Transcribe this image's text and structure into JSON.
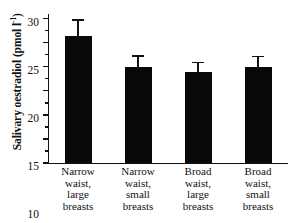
{
  "chart_data": {
    "type": "bar",
    "title": "",
    "xlabel": "",
    "ylabel": "Salivary oestradiol (pmol l",
    "ylabel_sup": "-1",
    "ylabel_tail": ")",
    "categories": [
      "Narrow waist, large breasts",
      "Narrow waist, small breasts",
      "Broad waist, large breasts",
      "Broad waist, small breasts"
    ],
    "category_lines": [
      [
        "Narrow",
        "waist,",
        "large",
        "breasts"
      ],
      [
        "Narrow",
        "waist,",
        "small",
        "breasts"
      ],
      [
        "Broad",
        "waist,",
        "large",
        "breasts"
      ],
      [
        "Broad",
        "waist,",
        "small",
        "breasts"
      ]
    ],
    "values": [
      26.4,
      19.9,
      18.9,
      20.0
    ],
    "errors": [
      3.5,
      2.5,
      2.2,
      2.3
    ],
    "error_type": "standard error",
    "ylim": [
      0,
      31
    ],
    "yticks": [
      0,
      5,
      10,
      15,
      20,
      25,
      30
    ],
    "ytick_labels": [
      "0",
      "5",
      "10",
      "15",
      "20",
      "25",
      "30"
    ],
    "grid": false,
    "legend": null,
    "bar_color": "#090909",
    "axis_color": "#111111"
  }
}
